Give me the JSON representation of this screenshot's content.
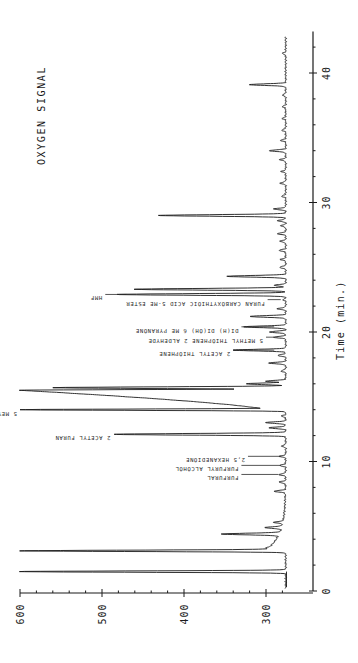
{
  "chart_data": {
    "type": "line",
    "title": "OXYGEN SIGNAL",
    "xlabel": "Time (min.)",
    "ylabel": "",
    "orientation": "rotated-90",
    "xlim": [
      0,
      43
    ],
    "ylim": [
      275,
      600
    ],
    "x_ticks": [
      0,
      10,
      20,
      30,
      40
    ],
    "x_tick_labels": [
      "0",
      "10",
      "20",
      "30",
      "40"
    ],
    "y_ticks": [
      300,
      400,
      500,
      600
    ],
    "y_tick_labels": [
      "300",
      "400",
      "500",
      "600"
    ],
    "grid": false,
    "legend": null,
    "baseline": 276,
    "peaks": [
      {
        "t": 1.5,
        "signal": 600,
        "label": ""
      },
      {
        "t": 3.1,
        "signal": 600,
        "label": ""
      },
      {
        "t": 3.3,
        "signal": 300,
        "label": ""
      },
      {
        "t": 4.4,
        "signal": 354,
        "label": ""
      },
      {
        "t": 4.9,
        "signal": 301,
        "label": ""
      },
      {
        "t": 5.3,
        "signal": 290,
        "label": ""
      },
      {
        "t": 7.7,
        "signal": 290,
        "label": ""
      },
      {
        "t": 8.4,
        "signal": 284,
        "label": ""
      },
      {
        "t": 9.0,
        "signal": 284,
        "label": "FURFURAL"
      },
      {
        "t": 9.7,
        "signal": 283,
        "label": "FURFURYL ALCOHOL"
      },
      {
        "t": 10.4,
        "signal": 283,
        "label": "2,5 HEXANEDIONE"
      },
      {
        "t": 11.2,
        "signal": 281,
        "label": ""
      },
      {
        "t": 12.1,
        "signal": 484,
        "label": "2 ACETYL FURAN"
      },
      {
        "t": 12.6,
        "signal": 296,
        "label": ""
      },
      {
        "t": 13.0,
        "signal": 300,
        "label": ""
      },
      {
        "t": 13.5,
        "signal": 281,
        "label": ""
      },
      {
        "t": 14.0,
        "signal": 600,
        "label": "5 MEYHYL FURFURAL"
      },
      {
        "t": 15.5,
        "signal": 600,
        "label": ""
      },
      {
        "t": 15.7,
        "signal": 560,
        "label": ""
      },
      {
        "t": 16.0,
        "signal": 324,
        "label": ""
      },
      {
        "t": 16.2,
        "signal": 300,
        "label": ""
      },
      {
        "t": 17.0,
        "signal": 282,
        "label": ""
      },
      {
        "t": 17.6,
        "signal": 296,
        "label": ""
      },
      {
        "t": 18.2,
        "signal": 286,
        "label": ""
      },
      {
        "t": 18.6,
        "signal": 340,
        "label": "2 ACETYL THIOPHENE"
      },
      {
        "t": 19.6,
        "signal": 290,
        "label": "5 METHYL THIOPHENE 2 ALDEHYDE"
      },
      {
        "t": 20.0,
        "signal": 296,
        "label": ""
      },
      {
        "t": 20.4,
        "signal": 328,
        "label": "DI(H) DI(OH) 6 ME PYRANONE"
      },
      {
        "t": 21.2,
        "signal": 320,
        "label": ""
      },
      {
        "t": 21.8,
        "signal": 286,
        "label": ""
      },
      {
        "t": 22.5,
        "signal": 279,
        "label": "FURAN CARBOXYTHIOIC ACID 5-ME ESTER"
      },
      {
        "t": 22.9,
        "signal": 482,
        "label": "HMF"
      },
      {
        "t": 23.3,
        "signal": 462,
        "label": ""
      },
      {
        "t": 23.6,
        "signal": 290,
        "label": ""
      },
      {
        "t": 24.3,
        "signal": 348,
        "label": ""
      },
      {
        "t": 25.0,
        "signal": 284,
        "label": ""
      },
      {
        "t": 25.6,
        "signal": 282,
        "label": ""
      },
      {
        "t": 26.3,
        "signal": 284,
        "label": ""
      },
      {
        "t": 27.0,
        "signal": 283,
        "label": ""
      },
      {
        "t": 27.6,
        "signal": 286,
        "label": ""
      },
      {
        "t": 28.2,
        "signal": 282,
        "label": ""
      },
      {
        "t": 28.6,
        "signal": 286,
        "label": ""
      },
      {
        "t": 29.0,
        "signal": 430,
        "label": ""
      },
      {
        "t": 29.5,
        "signal": 290,
        "label": ""
      },
      {
        "t": 30.5,
        "signal": 281,
        "label": ""
      },
      {
        "t": 31.5,
        "signal": 283,
        "label": ""
      },
      {
        "t": 32.4,
        "signal": 281,
        "label": ""
      },
      {
        "t": 33.3,
        "signal": 283,
        "label": ""
      },
      {
        "t": 34.0,
        "signal": 296,
        "label": ""
      },
      {
        "t": 34.8,
        "signal": 282,
        "label": ""
      },
      {
        "t": 35.6,
        "signal": 281,
        "label": ""
      },
      {
        "t": 36.5,
        "signal": 280,
        "label": ""
      },
      {
        "t": 37.4,
        "signal": 280,
        "label": ""
      },
      {
        "t": 38.3,
        "signal": 280,
        "label": ""
      },
      {
        "t": 39.1,
        "signal": 320,
        "label": ""
      },
      {
        "t": 41.5,
        "signal": 280,
        "label": ""
      }
    ],
    "annotations": [
      {
        "t": 9.0,
        "text": "FURFURAL",
        "line_from": 285,
        "line_to": 330
      },
      {
        "t": 9.7,
        "text": "FURFURYL ALCOHOL",
        "line_from": 282,
        "line_to": 330
      },
      {
        "t": 10.4,
        "text": "2,5 HEXANEDIONE",
        "line_from": 282,
        "line_to": 322
      },
      {
        "t": 12.1,
        "text": "2 ACETYL FURAN",
        "line_from": 486,
        "line_to": 486
      },
      {
        "t": 14.0,
        "text": "5 MEYHYL FURFURAL",
        "line_from": 600,
        "line_to": 600
      },
      {
        "t": 18.6,
        "text": "2 ACETYL THIOPHENE",
        "line_from": 290,
        "line_to": 340
      },
      {
        "t": 19.6,
        "text": "5 METHYL THIOPHENE 2 ALDEHYDE",
        "line_from": 290,
        "line_to": 300
      },
      {
        "t": 20.4,
        "text": "DI(H) DI(OH) 6 ME PYRANONE",
        "line_from": 290,
        "line_to": 330
      },
      {
        "t": 22.5,
        "text": "FURAN CARBOXYTHIOIC ACID 5-ME ESTER",
        "line_from": 282,
        "line_to": 298
      },
      {
        "t": 22.9,
        "text": "HMF",
        "line_from": 470,
        "line_to": 496
      }
    ]
  },
  "labels": {
    "title": "OXYGEN SIGNAL",
    "xlabel": "Time (min.)"
  }
}
